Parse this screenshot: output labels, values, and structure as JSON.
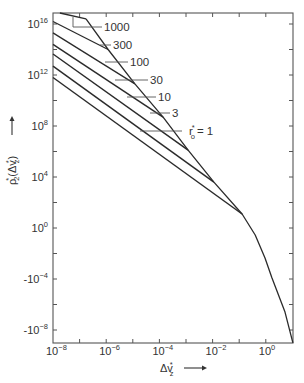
{
  "chart_data": {
    "type": "line",
    "title": "",
    "xlabel": "Δv_z*",
    "ylabel": "ρ_2*(Δv_z*)",
    "xscale": "log",
    "yscale": "log",
    "xlim": [
      1e-08,
      10
    ],
    "ylim": [
      1e-09,
      5e+16
    ],
    "x_ticks": [
      {
        "exp": -8,
        "label": "10",
        "sup": "−8"
      },
      {
        "exp": -6,
        "label": "10",
        "sup": "−6"
      },
      {
        "exp": -4,
        "label": "10",
        "sup": "−4"
      },
      {
        "exp": -2,
        "label": "10",
        "sup": "−2"
      },
      {
        "exp": 0,
        "label": "10",
        "sup": "0"
      }
    ],
    "y_ticks": [
      {
        "exp": 16,
        "label": "10",
        "sup": "16"
      },
      {
        "exp": 12,
        "label": "10",
        "sup": "12"
      },
      {
        "exp": 8,
        "label": "10",
        "sup": "8"
      },
      {
        "exp": 4,
        "label": "10",
        "sup": "4"
      },
      {
        "exp": 0,
        "label": "10",
        "sup": "0"
      },
      {
        "exp": -4,
        "label": "-10",
        "sup": "−4"
      },
      {
        "exp": -8,
        "label": "-10",
        "sup": "−8"
      }
    ],
    "grid": false,
    "legend": "inline labels with leader lines",
    "series_note": "points given as [log10(x), log10(y)]",
    "series": [
      {
        "name": "r0* = 1",
        "label": "r₀* = 1",
        "points": [
          [
            -8,
            11.8
          ],
          [
            -0.89,
            1.1
          ]
        ],
        "label_pos": {
          "x": 189,
          "y": 131,
          "leader": [
            140,
            182
          ]
        }
      },
      {
        "name": "r0* = 3",
        "label": "3",
        "points": [
          [
            -8,
            12.7
          ],
          [
            -1.95,
            3.6
          ]
        ],
        "label_pos": {
          "x": 172,
          "y": 113,
          "leader": [
            150,
            170
          ]
        }
      },
      {
        "name": "r0* = 10",
        "label": "10",
        "points": [
          [
            -8,
            13.65
          ],
          [
            -2.92,
            6.1
          ]
        ],
        "label_pos": {
          "x": 158,
          "y": 97,
          "leader": [
            127,
            156
          ]
        }
      },
      {
        "name": "r0* = 30",
        "label": "30",
        "points": [
          [
            -8,
            14.4
          ],
          [
            -3.86,
            8.7
          ]
        ],
        "label_pos": {
          "x": 150,
          "y": 80,
          "leader": [
            115,
            148
          ]
        }
      },
      {
        "name": "r0* = 100",
        "label": "100",
        "points": [
          [
            -8,
            15.3
          ],
          [
            -4.92,
            11.3
          ]
        ],
        "label_pos": {
          "x": 130,
          "y": 62,
          "leader": [
            105,
            128
          ]
        }
      },
      {
        "name": "r0* = 300",
        "label": "300",
        "points": [
          [
            -8,
            16.2
          ],
          [
            -5.93,
            14.0
          ]
        ],
        "label_pos": {
          "x": 113,
          "y": 45,
          "leader": [
            100,
            111
          ]
        }
      },
      {
        "name": "r0* = 1000",
        "label": "1000",
        "points": [
          [
            -7.74,
            16.86
          ],
          [
            -6.76,
            16.4
          ]
        ],
        "label_pos": {
          "x": 104,
          "y": 27,
          "leader": [
            73,
            102
          ]
        }
      }
    ],
    "envelope": {
      "name": "common envelope",
      "points": [
        [
          -6.76,
          16.4
        ],
        [
          -5.93,
          14.0
        ],
        [
          -4.92,
          11.3
        ],
        [
          -3.86,
          8.7
        ],
        [
          -2.92,
          6.1
        ],
        [
          -1.95,
          3.6
        ],
        [
          -0.89,
          1.1
        ],
        [
          -0.4,
          -0.55
        ],
        [
          -0.03,
          -2.35
        ],
        [
          0.23,
          -3.9
        ],
        [
          0.72,
          -6.6
        ],
        [
          1.02,
          -9.0
        ]
      ]
    }
  },
  "labels": {
    "xlabel_main": "Δv",
    "xlabel_sub": "z",
    "xlabel_star": "*",
    "ylabel_main": "ρ",
    "ylabel_sub": "2",
    "ylabel_arg": "(Δv",
    "ylabel_arg_sub": "z",
    "ylabel_close": ")",
    "r_label_main": "r",
    "r_label_sub": "o",
    "r_label_eq": "= 1"
  },
  "style": {
    "line_color": "#2b2b2b",
    "axis_color": "#555555",
    "background": "#ffffff"
  }
}
